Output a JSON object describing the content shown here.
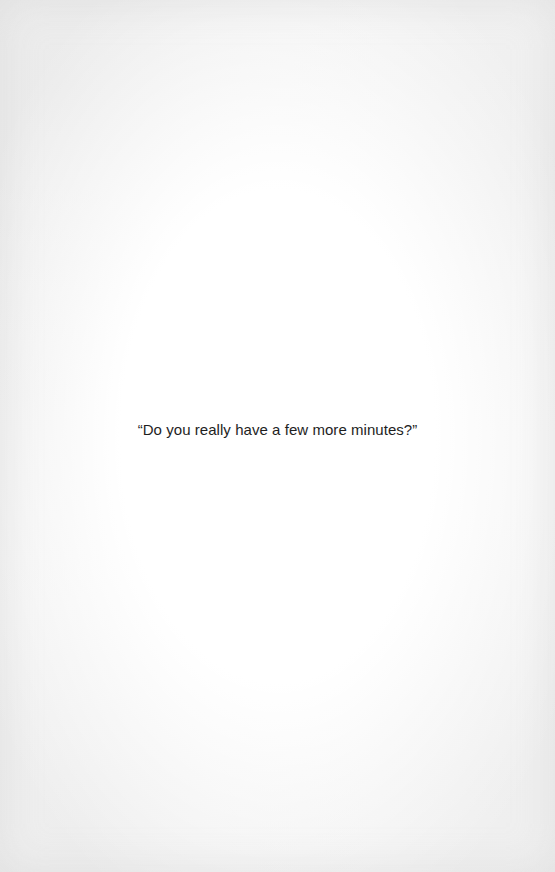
{
  "page": {
    "paragraphs": [
      {
        "text": "“Do you really have a few more minutes?”"
      }
    ]
  }
}
